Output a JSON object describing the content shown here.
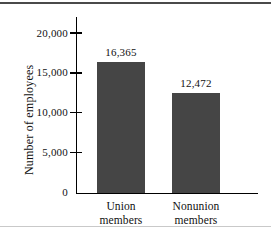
{
  "chart_data": {
    "type": "bar",
    "title": "",
    "xlabel": "",
    "ylabel": "Number of employees",
    "categories": [
      "Union members",
      "Nonunion members"
    ],
    "category_lines": [
      [
        "Union",
        "members"
      ],
      [
        "Nonunion",
        "members"
      ]
    ],
    "values": [
      16365,
      12472
    ],
    "value_labels": [
      "16,365",
      "12,472"
    ],
    "ylim": [
      0,
      20000
    ],
    "yticks": [
      0,
      5000,
      10000,
      15000,
      20000
    ],
    "ytick_labels": [
      "0",
      "5,000",
      "10,000",
      "15,000",
      "20,000"
    ],
    "grid": false,
    "legend": false,
    "bar_color": "#454545",
    "axis_color": "#000000",
    "text_color": "#111111"
  }
}
